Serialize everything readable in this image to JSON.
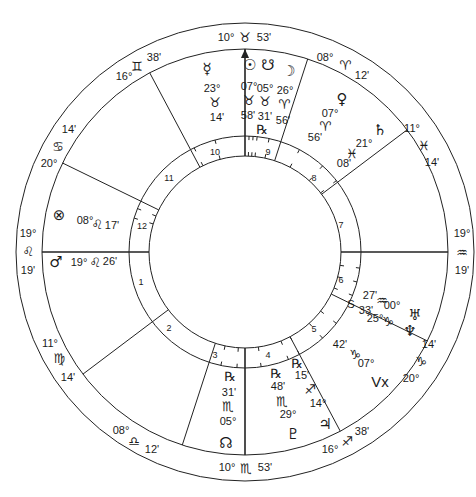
{
  "chart": {
    "center": [
      245,
      252
    ],
    "radii": {
      "outer": 229,
      "zodiac_inner": 203,
      "house_outer": 116,
      "house_inner": 96
    },
    "line_color": "#222222",
    "background": "#ffffff"
  },
  "cusps": [
    {
      "house": 1,
      "angle_deg": 180,
      "label": [
        "19°",
        "♌",
        "19'"
      ],
      "sign": "Leo",
      "pos": [
        [
          28,
          233
        ],
        [
          28,
          251
        ],
        [
          28,
          270
        ]
      ]
    },
    {
      "house": 2,
      "angle_deg": 217,
      "label": [
        "11°",
        "♍",
        "14'"
      ],
      "sign": "Virgo",
      "pos": [
        [
          50,
          343
        ],
        [
          59,
          358
        ],
        [
          68,
          377
        ]
      ]
    },
    {
      "house": 3,
      "angle_deg": 252,
      "label": [
        "08°",
        "♎",
        "12'"
      ],
      "sign": "Libra",
      "pos": [
        [
          121,
          430
        ],
        [
          134,
          441
        ],
        [
          152,
          449
        ]
      ]
    },
    {
      "house": 4,
      "angle_deg": 270,
      "label": [
        "10°",
        "♏",
        "53'"
      ],
      "sign": "Scorpio",
      "pos": [
        [
          227,
          467
        ],
        [
          246,
          468
        ],
        [
          265,
          467
        ]
      ]
    },
    {
      "house": 5,
      "angle_deg": 298,
      "label": [
        "16°",
        "♐",
        "38'"
      ],
      "sign": "Sagittarius",
      "pos": [
        [
          330,
          449
        ],
        [
          347,
          441
        ],
        [
          362,
          431
        ]
      ]
    },
    {
      "house": 6,
      "angle_deg": 334,
      "label": [
        "20°",
        "♑",
        "14'"
      ],
      "sign": "Capricorn",
      "pos": [
        [
          411,
          378
        ],
        [
          421,
          361
        ],
        [
          429,
          344
        ]
      ]
    },
    {
      "house": 7,
      "angle_deg": 0,
      "label": [
        "19°",
        "♒",
        "19'"
      ],
      "sign": "Aquarius",
      "pos": [
        [
          462,
          233
        ],
        [
          462,
          252
        ],
        [
          462,
          270
        ]
      ]
    },
    {
      "house": 8,
      "angle_deg": 37,
      "label": [
        "11°",
        "♓",
        "14'"
      ],
      "sign": "Pisces",
      "pos": [
        [
          412,
          128
        ],
        [
          424,
          145
        ],
        [
          432,
          162
        ]
      ]
    },
    {
      "house": 9,
      "angle_deg": 72,
      "label": [
        "08°",
        "♈",
        "12'"
      ],
      "sign": "Aries",
      "pos": [
        [
          325,
          57
        ],
        [
          345,
          65
        ],
        [
          362,
          75
        ]
      ]
    },
    {
      "house": 10,
      "angle_deg": 90,
      "label": [
        "10°",
        "♉",
        "53'"
      ],
      "sign": "Taurus",
      "pos": [
        [
          226,
          37
        ],
        [
          245,
          37
        ],
        [
          264,
          37
        ]
      ]
    },
    {
      "house": 11,
      "angle_deg": 118,
      "label": [
        "16°",
        "♊",
        "38'"
      ],
      "sign": "Gemini",
      "pos": [
        [
          124,
          76
        ],
        [
          137,
          66
        ],
        [
          154,
          57
        ]
      ]
    },
    {
      "house": 12,
      "angle_deg": 154,
      "label": [
        "20°",
        "♋",
        "14'"
      ],
      "sign": "Cancer",
      "pos": [
        [
          49,
          163
        ],
        [
          58,
          146
        ],
        [
          69,
          129
        ]
      ]
    }
  ],
  "house_numbers": [
    {
      "n": "1",
      "pos": [
        141,
        282
      ]
    },
    {
      "n": "2",
      "pos": [
        169,
        328
      ]
    },
    {
      "n": "3",
      "pos": [
        215,
        355
      ]
    },
    {
      "n": "4",
      "pos": [
        268,
        355
      ]
    },
    {
      "n": "5",
      "pos": [
        314,
        329
      ]
    },
    {
      "n": "6",
      "pos": [
        341,
        280
      ]
    },
    {
      "n": "7",
      "pos": [
        341,
        225
      ]
    },
    {
      "n": "8",
      "pos": [
        314,
        178
      ]
    },
    {
      "n": "9",
      "pos": [
        268,
        152
      ]
    },
    {
      "n": "10",
      "pos": [
        215,
        152
      ]
    },
    {
      "n": "11",
      "pos": [
        169,
        178
      ]
    },
    {
      "n": "12",
      "pos": [
        142,
        226
      ]
    }
  ],
  "planets": [
    {
      "name": "Sun",
      "glyph": "☉",
      "degree": "07°",
      "sign": "♉",
      "minute": "58'",
      "retro": "",
      "col": [
        [
          250,
          65
        ],
        [
          249,
          86
        ],
        [
          249,
          100
        ],
        [
          248,
          115
        ]
      ]
    },
    {
      "name": "South Node",
      "glyph": "☋",
      "degree": "05°",
      "sign": "♉",
      "minute": "31'",
      "retro": "℞",
      "col": [
        [
          268,
          65
        ],
        [
          265,
          88
        ],
        [
          265,
          101
        ],
        [
          265,
          116
        ],
        [
          262,
          129
        ]
      ]
    },
    {
      "name": "Moon",
      "glyph": "☽",
      "degree": "26°",
      "sign": "♈",
      "minute": "56'",
      "retro": "",
      "col": [
        [
          289,
          71
        ],
        [
          285,
          90
        ],
        [
          284,
          104
        ],
        [
          283,
          120
        ]
      ]
    },
    {
      "name": "Mercury",
      "glyph": "☿",
      "degree": "23°",
      "sign": "♉",
      "minute": "14'",
      "retro": "",
      "col": [
        [
          207,
          69
        ],
        [
          212,
          88
        ],
        [
          215,
          102
        ],
        [
          217,
          117
        ]
      ]
    },
    {
      "name": "Venus",
      "glyph": "♀",
      "degree": "07°",
      "sign": "♈",
      "minute": "56'",
      "retro": "",
      "col": [
        [
          342,
          99
        ],
        [
          330,
          113
        ],
        [
          325,
          126
        ],
        [
          315,
          137
        ]
      ]
    },
    {
      "name": "Saturn",
      "glyph": "♄",
      "degree": "21°",
      "sign": "♓",
      "minute": "08'",
      "retro": "",
      "col": [
        [
          380,
          130
        ],
        [
          364,
          143
        ],
        [
          352,
          153
        ],
        [
          344,
          163
        ]
      ]
    },
    {
      "name": "Part of Fortune",
      "glyph": "⊗",
      "degree": "08°",
      "sign": "♌",
      "minute": "17'",
      "retro": "",
      "inline": [
        [
          59,
          215
        ],
        [
          85,
          220
        ],
        [
          97,
          224
        ],
        [
          112,
          225
        ]
      ]
    },
    {
      "name": "Mars",
      "glyph": "♂",
      "degree": "19°",
      "sign": "♌",
      "minute": "26'",
      "retro": "",
      "inline": [
        [
          56,
          262
        ],
        [
          79,
          262
        ],
        [
          95,
          262
        ],
        [
          110,
          261
        ]
      ]
    },
    {
      "name": "Uranus",
      "glyph": "♅",
      "degree": "00°",
      "sign": "♒",
      "minute": "27'",
      "retro": "",
      "col": [
        [
          415,
          315
        ],
        [
          392,
          305
        ],
        [
          382,
          300
        ],
        [
          370,
          295
        ]
      ]
    },
    {
      "name": "South Node Vertex S",
      "glyph": "S",
      "degree": "",
      "sign": "",
      "minute": "33'",
      "retro": "",
      "col": [
        [
          351,
          304
        ],
        [
          366,
          310
        ]
      ]
    },
    {
      "name": "Neptune",
      "glyph": "♆",
      "degree": "25°",
      "sign": "♑",
      "minute": "33'",
      "retro": "",
      "col": [
        [
          410,
          331
        ],
        [
          388,
          321
        ],
        [
          375,
          318
        ]
      ]
    },
    {
      "name": "Vertex",
      "glyph": "Vx",
      "degree": "07°",
      "sign": "♑",
      "minute": "42'",
      "retro": "",
      "col": [
        [
          380,
          381
        ],
        [
          366,
          363
        ],
        [
          355,
          354
        ],
        [
          340,
          344
        ]
      ]
    },
    {
      "name": "Jupiter",
      "glyph": "♃",
      "degree": "14°",
      "sign": "♐",
      "minute": "15'",
      "retro": "℞",
      "col": [
        [
          325,
          424
        ],
        [
          318,
          403
        ],
        [
          310,
          389
        ],
        [
          302,
          375
        ],
        [
          297,
          363
        ]
      ]
    },
    {
      "name": "Pluto",
      "glyph": "♇",
      "degree": "29°",
      "sign": "♏",
      "minute": "48'",
      "retro": "℞",
      "col": [
        [
          293,
          434
        ],
        [
          288,
          414
        ],
        [
          282,
          401
        ],
        [
          278,
          386
        ],
        [
          276,
          373
        ]
      ]
    },
    {
      "name": "North Node",
      "glyph": "☊",
      "degree": "05°",
      "sign": "♏",
      "minute": "31'",
      "retro": "℞",
      "col": [
        [
          226,
          443
        ],
        [
          228,
          421
        ],
        [
          228,
          406
        ],
        [
          229,
          392
        ],
        [
          230,
          376
        ]
      ]
    }
  ],
  "labels": {
    "sun": {
      "g": "☉",
      "d": "07°",
      "s": "♉",
      "m": "58'"
    },
    "snode": {
      "g": "☋",
      "d": "05°",
      "s": "♉",
      "m": "31'",
      "r": "℞"
    },
    "moon": {
      "g": "☽",
      "d": "26°",
      "s": "♈",
      "m": "56'"
    },
    "mercury": {
      "g": "☿",
      "d": "23°",
      "s": "♉",
      "m": "14'"
    },
    "venus": {
      "g": "♀",
      "d": "07°",
      "s": "♈",
      "m": "56'"
    },
    "saturn": {
      "g": "♄",
      "d": "21°",
      "s": "♓",
      "m": "08'"
    },
    "fortune": {
      "g": "⊗",
      "d": "08°",
      "s": "♌",
      "m": "17'"
    },
    "mars": {
      "g": "♂",
      "d": "19°",
      "s": "♌",
      "m": "26'"
    },
    "uranus": {
      "g": "♅",
      "d": "00°",
      "s": "♒",
      "m": "27'"
    },
    "neptune": {
      "g": "♆",
      "d": "25°",
      "s": "♑",
      "m": "33'",
      "s_label": "S"
    },
    "vertex": {
      "g": "Vx",
      "d": "07°",
      "s": "♑",
      "m": "42'"
    },
    "jupiter": {
      "g": "♃",
      "d": "14°",
      "s": "♐",
      "m": "15'",
      "r": "℞"
    },
    "pluto": {
      "g": "♇",
      "d": "29°",
      "s": "♏",
      "m": "48'",
      "r": "℞"
    },
    "nnode": {
      "g": "☊",
      "d": "05°",
      "s": "♏",
      "m": "31'",
      "r": "℞"
    }
  }
}
